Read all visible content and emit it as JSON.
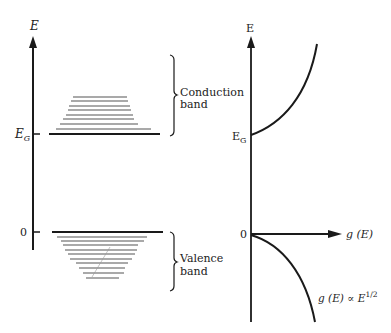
{
  "left_diagram": {
    "axis_label": "E",
    "eg_label": "E",
    "eg_subscript": "G",
    "zero_label": "0",
    "conduction_label_line1": "Conduction",
    "conduction_label_line2": "band",
    "valence_label_line1": "Valence",
    "valence_label_line2": "band"
  },
  "right_diagram": {
    "axis_label": "E",
    "eg_label": "E",
    "eg_subscript": "G",
    "zero_label": "0",
    "x_axis_label": "g (E)",
    "curve_label_prefix": "g (E) ∝ E",
    "curve_label_exponent": "1/2"
  },
  "colors": {
    "ink": "#1a1a1a",
    "level_lines": "#555555",
    "background": "#ffffff"
  }
}
